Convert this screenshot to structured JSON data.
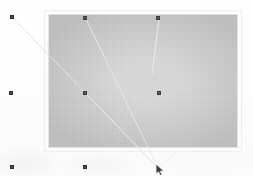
{
  "screen": {
    "width": 253,
    "height": 176,
    "background_color": "#fdfdfd",
    "description": "Faded screenshot of a gray canvas panel with selection handles and guide lines"
  },
  "panel": {
    "name": "canvas-panel",
    "x": 44,
    "y": 10,
    "width": 198,
    "height": 142,
    "fill_center_color": "#d7d7d7",
    "fill_edge_color": "#bdbdbd",
    "frame_color": "#fcfcfc",
    "border_color": "#e3e3e3",
    "label": ""
  },
  "handles": [
    {
      "id": "handle-outer-top-left",
      "x": 12,
      "y": 17,
      "on_page": false,
      "label": ""
    },
    {
      "id": "handle-outer-mid-left",
      "x": 11,
      "y": 93,
      "on_page": false,
      "label": ""
    },
    {
      "id": "handle-outer-bottom-left",
      "x": 12,
      "y": 167,
      "on_page": false,
      "label": ""
    },
    {
      "id": "handle-canvas-top-left",
      "x": 85,
      "y": 18,
      "on_page": true,
      "label": ""
    },
    {
      "id": "handle-canvas-top-right",
      "x": 158,
      "y": 18,
      "on_page": true,
      "label": ""
    },
    {
      "id": "handle-canvas-mid-left",
      "x": 85,
      "y": 93,
      "on_page": true,
      "label": ""
    },
    {
      "id": "handle-canvas-mid-right",
      "x": 159,
      "y": 93,
      "on_page": true,
      "label": ""
    },
    {
      "id": "handle-outer-bottom-mid",
      "x": 85,
      "y": 167,
      "on_page": false,
      "label": ""
    }
  ],
  "guides": [
    {
      "id": "guide-topleft-to-pointer",
      "x1": 13,
      "y1": 18,
      "x2": 158,
      "y2": 168,
      "color": "#e4e4e6",
      "width": 1
    },
    {
      "id": "guide-canvas-to-pointer",
      "x1": 86,
      "y1": 19,
      "x2": 158,
      "y2": 168,
      "color": "#e8e8ea",
      "width": 1
    },
    {
      "id": "guide-midleft-to-pointer",
      "x1": 86,
      "y1": 94,
      "x2": 158,
      "y2": 168,
      "color": "#e6e6e8",
      "width": 1
    },
    {
      "id": "guide-topright-down",
      "x1": 159,
      "y1": 19,
      "x2": 152,
      "y2": 74,
      "color": "#ececee",
      "width": 1
    },
    {
      "id": "guide-pointer-tail",
      "x1": 158,
      "y1": 168,
      "x2": 176,
      "y2": 152,
      "color": "#ededef",
      "width": 1
    }
  ],
  "cursor": {
    "name": "mouse-pointer",
    "x": 155,
    "y": 163,
    "fill": "#3d3d3d",
    "stroke": "#ffffff"
  },
  "texture_blobs": [
    {
      "id": "wash-blob-bottom-left",
      "class": "b1"
    },
    {
      "id": "wash-blob-bottom-mid",
      "class": "b2"
    },
    {
      "id": "wash-blob-bottom-right",
      "class": "b3"
    }
  ]
}
